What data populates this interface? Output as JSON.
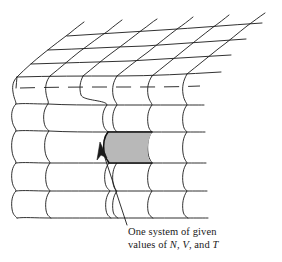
{
  "figure": {
    "name": "ensemble-of-systems-diagram",
    "background_color": "#ffffff",
    "line_color": "#1a1a1a",
    "highlight_fill_color": "#b8b8b8",
    "highlight_stroke_color": "#111111",
    "arrow_color": "#1a1a1a"
  },
  "annotation": {
    "arrow_name": "callout-arrow",
    "caption_line_1": "One system of given",
    "caption_line_2_prefix": "values of ",
    "caption_var_1": "N",
    "caption_sep_1": ", ",
    "caption_var_2": "V",
    "caption_sep_2": ", and ",
    "caption_var_3": "T",
    "caption_full": "One system of given values of N, V, and T"
  },
  "grid": {
    "front_face_rows": 5,
    "front_face_columns": 5,
    "top_face_depth_rows": 3,
    "highlighted_cell_row": 2,
    "highlighted_cell_column": 3,
    "hidden_edge_style": "dashed"
  }
}
